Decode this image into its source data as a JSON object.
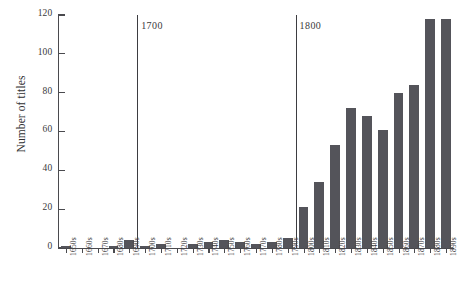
{
  "chart_data": {
    "type": "bar",
    "title": "",
    "subtitle": "",
    "xlabel": "",
    "ylabel": "Number of titles",
    "ylim": [
      0,
      120
    ],
    "ytick_values": [
      0,
      20,
      40,
      60,
      80,
      100,
      120
    ],
    "ytick_labels": [
      "0",
      "20",
      "40",
      "60",
      "80",
      "100",
      "120"
    ],
    "grid": false,
    "legend": null,
    "bar_color": "#54545a",
    "background_color": "#ffffff",
    "axis_color": "#4a4a4e",
    "categories": [
      "1650s",
      "1660s",
      "1670s",
      "1680s",
      "1690s",
      "1700s",
      "1710s",
      "1720s",
      "1730s",
      "1740s",
      "1750s",
      "1760s",
      "1770s",
      "1780s",
      "1790s",
      "1800s",
      "1810s",
      "1820s",
      "1830s",
      "1840s",
      "1850s",
      "1860s",
      "1870s",
      "1880s",
      "1890s"
    ],
    "values": [
      1,
      0,
      0,
      1,
      4,
      1,
      2,
      0,
      2,
      3,
      4,
      3,
      2,
      3,
      5,
      21,
      34,
      53,
      72,
      68,
      61,
      80,
      84,
      118,
      118
    ],
    "annotations": [
      {
        "name": "century-1700",
        "label": "1700",
        "at_category_index": 5,
        "type": "vertical-line"
      },
      {
        "name": "century-1800",
        "label": "1800",
        "at_category_index": 15,
        "type": "vertical-line"
      }
    ]
  }
}
